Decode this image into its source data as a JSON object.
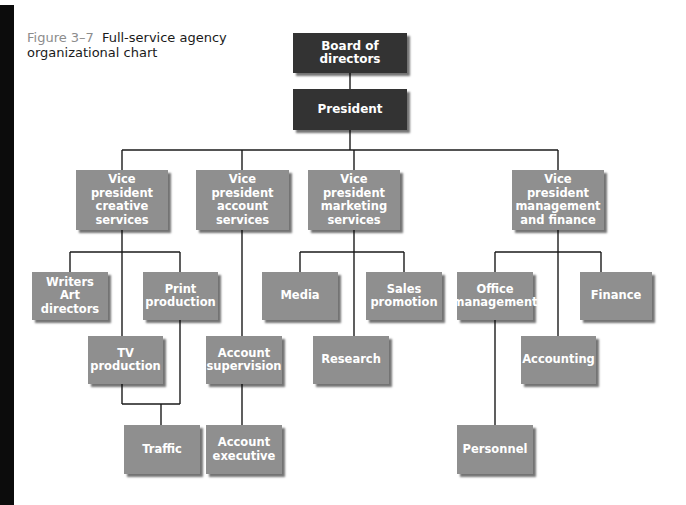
{
  "caption": {
    "figure_number": "Figure 3–7",
    "title": "Full-service agency organizational chart"
  },
  "colors": {
    "top_level_box": "#333333",
    "box": "#8f8f8f",
    "box_text": "#ffffff",
    "connector": "#1a1a1a",
    "side_bar": "#0c0c0c",
    "figure_number": "#8c8c8c"
  },
  "nodes": {
    "board": {
      "label": "Board of directors"
    },
    "president": {
      "label": "President"
    },
    "vp_creative": {
      "label": "Vice president\ncreative\nservices"
    },
    "vp_account": {
      "label": "Vice president\naccount\nservices"
    },
    "vp_marketing": {
      "label": "Vice president\nmarketing\nservices"
    },
    "vp_management": {
      "label": "Vice president\nmanagement\nand finance"
    },
    "writers": {
      "label": "Writers\nArt directors"
    },
    "print_production": {
      "label": "Print\nproduction"
    },
    "tv_production": {
      "label": "TV\nproduction"
    },
    "traffic": {
      "label": "Traffic"
    },
    "account_supervision": {
      "label": "Account\nsupervision"
    },
    "account_executive": {
      "label": "Account\nexecutive"
    },
    "media": {
      "label": "Media"
    },
    "sales_promotion": {
      "label": "Sales\npromotion"
    },
    "research": {
      "label": "Research"
    },
    "office_management": {
      "label": "Office\nmanagement"
    },
    "finance": {
      "label": "Finance"
    },
    "accounting": {
      "label": "Accounting"
    },
    "personnel": {
      "label": "Personnel"
    }
  },
  "hierarchy": [
    {
      "parent": "Board of directors",
      "children": [
        "President"
      ]
    },
    {
      "parent": "President",
      "children": [
        "Vice president creative services",
        "Vice president account services",
        "Vice president marketing services",
        "Vice president management and finance"
      ]
    },
    {
      "parent": "Vice president creative services",
      "children": [
        "Writers Art directors",
        "Print production",
        "TV production"
      ]
    },
    {
      "parent": "Print production + TV production",
      "children": [
        "Traffic"
      ]
    },
    {
      "parent": "Vice president account services",
      "children": [
        "Account supervision"
      ]
    },
    {
      "parent": "Account supervision",
      "children": [
        "Account executive"
      ]
    },
    {
      "parent": "Vice president marketing services",
      "children": [
        "Media",
        "Sales promotion",
        "Research"
      ]
    },
    {
      "parent": "Vice president management and finance",
      "children": [
        "Office management",
        "Finance",
        "Accounting"
      ]
    },
    {
      "parent": "Office management",
      "children": [
        "Personnel"
      ]
    }
  ]
}
